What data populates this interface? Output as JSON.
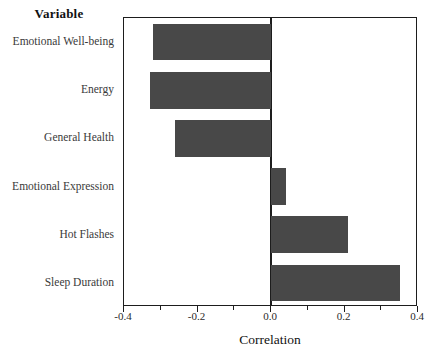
{
  "chart_data": {
    "type": "bar",
    "orientation": "horizontal",
    "title": "",
    "ylabel": "Variable",
    "xlabel": "Correlation",
    "categories": [
      "Emotional Well-being",
      "Energy",
      "General Health",
      "Emotional Expression",
      "Hot Flashes",
      "Sleep Duration"
    ],
    "values": [
      -0.32,
      -0.33,
      -0.26,
      0.04,
      0.21,
      0.35
    ],
    "xlim": [
      -0.4,
      0.4
    ],
    "xticks": [
      -0.4,
      -0.2,
      0.0,
      0.2,
      0.4
    ],
    "xtick_labels": [
      "-0.4",
      "-0.2",
      "0.0",
      "0.2",
      "0.4"
    ],
    "minor_ticks": [
      -0.3,
      -0.1,
      0.1,
      0.3
    ],
    "grid": false,
    "legend": null,
    "bar_color": "#484848",
    "axis_color": "#1d1d1d",
    "background": "#ffffff"
  }
}
